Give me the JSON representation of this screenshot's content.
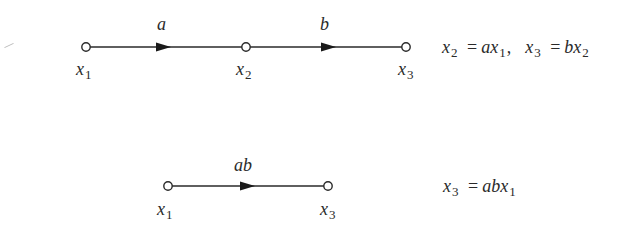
{
  "diagram": {
    "colors": {
      "stroke": "#2a2a2a",
      "node_fill": "#ffffff",
      "background": "#ffffff"
    },
    "top_graph": {
      "nodes": [
        {
          "id": "x1",
          "base": "x",
          "sub": "1",
          "cx": 86,
          "cy": 47
        },
        {
          "id": "x2",
          "base": "x",
          "sub": "2",
          "cx": 246,
          "cy": 47
        },
        {
          "id": "x3",
          "base": "x",
          "sub": "3",
          "cx": 406,
          "cy": 47
        }
      ],
      "branches": [
        {
          "from": "x1",
          "to": "x2",
          "gain": "a"
        },
        {
          "from": "x2",
          "to": "x3",
          "gain": "b"
        }
      ],
      "equation": {
        "part1": {
          "lhs_base": "x",
          "lhs_sub": "2",
          "eq": "=",
          "rhs_coef": "a",
          "rhs_base": "x",
          "rhs_sub": "1",
          "sep": ","
        },
        "part2": {
          "lhs_base": "x",
          "lhs_sub": "3",
          "eq": "=",
          "rhs_coef": "b",
          "rhs_base": "x",
          "rhs_sub": "2"
        }
      }
    },
    "bottom_graph": {
      "nodes": [
        {
          "id": "x1",
          "base": "x",
          "sub": "1",
          "cx": 168,
          "cy": 186
        },
        {
          "id": "x3",
          "base": "x",
          "sub": "3",
          "cx": 328,
          "cy": 186
        }
      ],
      "branches": [
        {
          "from": "x1",
          "to": "x3",
          "gain": "ab"
        }
      ],
      "equation": {
        "lhs_base": "x",
        "lhs_sub": "3",
        "eq": "=",
        "rhs_coef": "ab",
        "rhs_base": "x",
        "rhs_sub": "1"
      }
    }
  }
}
